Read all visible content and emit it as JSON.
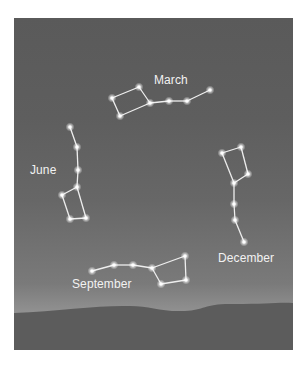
{
  "diagram": {
    "colors": {
      "sky_top": "#5a5a5a",
      "sky_bottom": "#a3a3a3",
      "ground": "#5c5c5c",
      "star": "#ffffff",
      "line": "#eeeeee",
      "label": "#f2f2f2"
    },
    "constellations": [
      {
        "label": "March",
        "label_pos": [
          154,
          84
        ],
        "stars": [
          [
            112,
            98
          ],
          [
            139,
            87
          ],
          [
            150,
            103
          ],
          [
            169,
            101
          ],
          [
            187,
            101
          ],
          [
            210,
            90
          ],
          [
            120,
            116
          ]
        ],
        "lines": [
          [
            0,
            1
          ],
          [
            1,
            2
          ],
          [
            2,
            3
          ],
          [
            3,
            4
          ],
          [
            4,
            5
          ],
          [
            2,
            6
          ],
          [
            6,
            0
          ]
        ]
      },
      {
        "label": "June",
        "label_pos": [
          30,
          174
        ],
        "stars": [
          [
            70,
            127
          ],
          [
            77,
            147
          ],
          [
            78,
            170
          ],
          [
            77,
            187
          ],
          [
            62,
            195
          ],
          [
            70,
            219
          ],
          [
            86,
            218
          ]
        ],
        "lines": [
          [
            0,
            1
          ],
          [
            1,
            2
          ],
          [
            2,
            3
          ],
          [
            3,
            4
          ],
          [
            4,
            5
          ],
          [
            5,
            6
          ],
          [
            6,
            3
          ]
        ]
      },
      {
        "label": "December",
        "label_pos": [
          218,
          262
        ],
        "stars": [
          [
            222,
            153
          ],
          [
            241,
            147
          ],
          [
            248,
            174
          ],
          [
            234,
            183
          ],
          [
            234,
            204
          ],
          [
            235,
            220
          ],
          [
            244,
            242
          ]
        ],
        "lines": [
          [
            0,
            1
          ],
          [
            1,
            2
          ],
          [
            2,
            3
          ],
          [
            3,
            0
          ],
          [
            3,
            4
          ],
          [
            4,
            5
          ],
          [
            5,
            6
          ]
        ]
      },
      {
        "label": "September",
        "label_pos": [
          72,
          288
        ],
        "stars": [
          [
            92,
            271
          ],
          [
            114,
            265
          ],
          [
            133,
            265
          ],
          [
            152,
            268
          ],
          [
            185,
            256
          ],
          [
            186,
            280
          ],
          [
            161,
            284
          ]
        ],
        "lines": [
          [
            0,
            1
          ],
          [
            1,
            2
          ],
          [
            2,
            3
          ],
          [
            3,
            4
          ],
          [
            4,
            5
          ],
          [
            5,
            6
          ],
          [
            6,
            3
          ]
        ]
      }
    ]
  }
}
